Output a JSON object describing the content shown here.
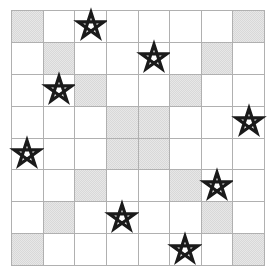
{
  "puzzle": {
    "title": "Star Grid",
    "grid": {
      "rows": 8,
      "columns": 8,
      "cell_size_px": 31.75,
      "line_color": "#b0b0b0",
      "background_color": "#ffffff",
      "shaded_color": "#d8d8d8",
      "star_color": "#1a1a1a",
      "star_icon": "pentagram-star-outline"
    },
    "legend": {
      "shaded_label": "shaded cell",
      "star_label": "star",
      "empty_label": "empty cell"
    },
    "counts": {
      "total_cells": 64,
      "shaded_cells": 16,
      "stars": 8
    },
    "shaded_cells": [
      {
        "row": 1,
        "col": 1
      },
      {
        "row": 1,
        "col": 8
      },
      {
        "row": 2,
        "col": 2
      },
      {
        "row": 2,
        "col": 7
      },
      {
        "row": 3,
        "col": 3
      },
      {
        "row": 3,
        "col": 6
      },
      {
        "row": 4,
        "col": 4
      },
      {
        "row": 4,
        "col": 5
      },
      {
        "row": 5,
        "col": 4
      },
      {
        "row": 5,
        "col": 5
      },
      {
        "row": 6,
        "col": 3
      },
      {
        "row": 6,
        "col": 6
      },
      {
        "row": 7,
        "col": 2
      },
      {
        "row": 7,
        "col": 7
      },
      {
        "row": 8,
        "col": 1
      },
      {
        "row": 8,
        "col": 8
      }
    ],
    "stars": [
      {
        "row": 1,
        "col": 3
      },
      {
        "row": 2,
        "col": 5
      },
      {
        "row": 3,
        "col": 2
      },
      {
        "row": 4,
        "col": 8
      },
      {
        "row": 5,
        "col": 1
      },
      {
        "row": 6,
        "col": 7
      },
      {
        "row": 7,
        "col": 4
      },
      {
        "row": 8,
        "col": 6
      }
    ]
  }
}
